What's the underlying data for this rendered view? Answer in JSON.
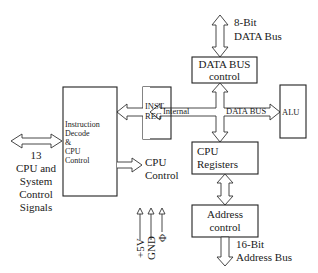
{
  "diagram": {
    "blocks": {
      "instruction_decode": [
        "Instruction",
        "Decode",
        "&",
        "CPU",
        "Control"
      ],
      "inst_reg": [
        "INST.",
        "REG"
      ],
      "data_bus_control": [
        "DATA BUS",
        "control"
      ],
      "alu": "ALU",
      "cpu_registers": [
        "CPU",
        "Registers"
      ],
      "address_control": [
        "Address",
        "control"
      ]
    },
    "labels": {
      "data_bus_8bit": [
        "8-Bit",
        "DATA Bus"
      ],
      "address_bus_16bit": [
        "16-Bit",
        "Address Bus"
      ],
      "internal": "Internal",
      "internal_data_bus": "DATA BUS",
      "control_signals": [
        "13",
        "CPU and",
        "System",
        "Control",
        "Signals"
      ],
      "cpu_control_out": [
        "CPU",
        "Control"
      ],
      "power_pins": [
        "+5V",
        "GND",
        "Φ"
      ]
    }
  }
}
